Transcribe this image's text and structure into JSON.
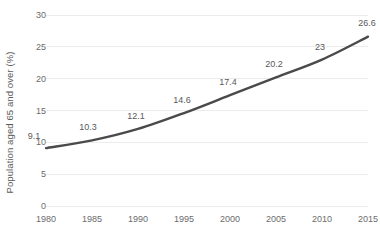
{
  "chart_data": {
    "type": "line",
    "title": "",
    "subtitle": "",
    "xlabel": "",
    "ylabel": "Population aged 65 and over (%)",
    "categories": [
      "1980",
      "1985",
      "1990",
      "1995",
      "2000",
      "2005",
      "2010",
      "2015"
    ],
    "x": [
      1980,
      1985,
      1990,
      1995,
      2000,
      2005,
      2010,
      2015
    ],
    "values": [
      9.1,
      10.3,
      12.1,
      14.6,
      17.4,
      20.2,
      23,
      26.6
    ],
    "point_labels": [
      "9.1",
      "10.3",
      "12.1",
      "14.6",
      "17.4",
      "20.2",
      "23",
      "26.6"
    ],
    "series": [
      {
        "name": "Population aged 65 and over (%)",
        "values": [
          9.1,
          10.3,
          12.1,
          14.6,
          17.4,
          20.2,
          23,
          26.6
        ],
        "color": "#4a4a4c"
      }
    ],
    "ylim": [
      0,
      30
    ],
    "yticks": [
      0,
      5,
      10,
      15,
      20,
      25,
      30
    ],
    "ytick_labels": [
      "0",
      "5",
      "10",
      "15",
      "20",
      "25",
      "30"
    ],
    "xlim": [
      1980,
      2015
    ],
    "xticks": [
      1980,
      1985,
      1990,
      1995,
      2000,
      2005,
      2010,
      2015
    ],
    "xtick_labels": [
      "1980",
      "1985",
      "1990",
      "1995",
      "2000",
      "2005",
      "2010",
      "2015"
    ],
    "grid": "horizontal",
    "legend": "none",
    "data_labels_shown": true,
    "markers": false,
    "colors": {
      "line": "#4a4a4c",
      "gridline": "#ececed",
      "tick_label": "#6b6b6d",
      "data_label": "#59595b",
      "axis_title": "#59595b",
      "background": "#ffffff"
    }
  }
}
